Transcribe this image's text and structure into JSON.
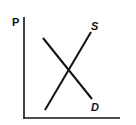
{
  "diagram": {
    "y_axis_label": "P",
    "x_axis_label": "",
    "curves": [
      {
        "name": "supply",
        "label": "S",
        "from": [
          45,
          110
        ],
        "to": [
          91,
          32
        ]
      },
      {
        "name": "demand",
        "label": "D",
        "from": [
          43,
          38
        ],
        "to": [
          92,
          99
        ]
      }
    ],
    "colors": {
      "line": "#111111",
      "background": "#ffffff"
    }
  }
}
